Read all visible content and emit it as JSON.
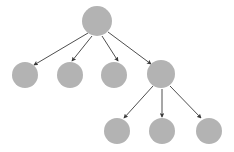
{
  "diagram": {
    "type": "tree",
    "width": 234,
    "height": 152,
    "background_color": "#ffffff",
    "node_fill_color": "#b3b3b3",
    "edge_color": "#3a3a3a",
    "edge_width": 0.9,
    "arrowhead": "solid-triangle",
    "node_count": 8,
    "edge_count": 7,
    "depth": 3,
    "nodes": [
      {
        "id": "root",
        "label": "",
        "cx": 97,
        "cy": 21,
        "r": 15,
        "level": 0,
        "name": "root-node"
      },
      {
        "id": "c1",
        "label": "",
        "cx": 25,
        "cy": 75,
        "r": 13,
        "level": 1,
        "name": "child-node-1"
      },
      {
        "id": "c2",
        "label": "",
        "cx": 70,
        "cy": 75,
        "r": 13,
        "level": 1,
        "name": "child-node-2"
      },
      {
        "id": "c3",
        "label": "",
        "cx": 114,
        "cy": 75,
        "r": 13,
        "level": 1,
        "name": "child-node-3"
      },
      {
        "id": "c4",
        "label": "",
        "cx": 161,
        "cy": 74,
        "r": 14,
        "level": 1,
        "name": "child-node-4"
      },
      {
        "id": "g1",
        "label": "",
        "cx": 117,
        "cy": 131,
        "r": 13,
        "level": 2,
        "name": "grandchild-node-1"
      },
      {
        "id": "g2",
        "label": "",
        "cx": 162,
        "cy": 131,
        "r": 13,
        "level": 2,
        "name": "grandchild-node-2"
      },
      {
        "id": "g3",
        "label": "",
        "cx": 209,
        "cy": 131,
        "r": 13,
        "level": 2,
        "name": "grandchild-node-3"
      }
    ],
    "edges": [
      {
        "from": "root",
        "to": "c1",
        "x1": 88,
        "y1": 33,
        "x2": 34,
        "y2": 65,
        "name": "edge-root-to-child-1"
      },
      {
        "from": "root",
        "to": "c2",
        "x1": 92,
        "y1": 36,
        "x2": 72,
        "y2": 61,
        "name": "edge-root-to-child-2"
      },
      {
        "from": "root",
        "to": "c3",
        "x1": 102,
        "y1": 36,
        "x2": 118,
        "y2": 61,
        "name": "edge-root-to-child-3"
      },
      {
        "from": "root",
        "to": "c4",
        "x1": 108,
        "y1": 32,
        "x2": 151,
        "y2": 64,
        "name": "edge-root-to-child-4"
      },
      {
        "from": "c4",
        "to": "g1",
        "x1": 153,
        "y1": 86,
        "x2": 124,
        "y2": 118,
        "name": "edge-child4-to-grandchild-1"
      },
      {
        "from": "c4",
        "to": "g2",
        "x1": 162,
        "y1": 89,
        "x2": 162,
        "y2": 117,
        "name": "edge-child4-to-grandchild-2"
      },
      {
        "from": "c4",
        "to": "g3",
        "x1": 170,
        "y1": 86,
        "x2": 201,
        "y2": 118,
        "name": "edge-child4-to-grandchild-3"
      }
    ]
  }
}
